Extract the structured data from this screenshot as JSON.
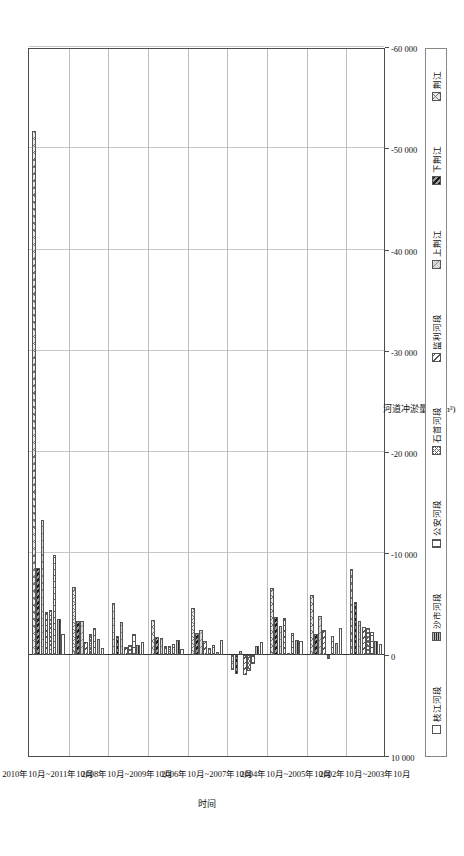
{
  "chart_data": {
    "type": "bar",
    "orientation": "horizontal-grouped",
    "title": "",
    "xlabel": "时间",
    "ylabel": "河道冲淤量(10⁴m³)",
    "ylim": [
      10000,
      -60000
    ],
    "ytick_labels": [
      "10 000",
      "0",
      "-10 000",
      "-20 000",
      "-30 000",
      "-40 000",
      "-50 000",
      "-60 000"
    ],
    "ytick_values": [
      10000,
      0,
      -10000,
      -20000,
      -30000,
      -40000,
      -50000,
      -60000
    ],
    "grid": true,
    "legend_position": "bottom",
    "categories": [
      "2002年10月~2003年10月",
      "",
      "2004年10月~2005年10月",
      "",
      "2006年10月~2007年10月",
      "",
      "2008年10月~2009年10月",
      "",
      "2010年10月~2011年10月"
    ],
    "xtick_labels": [
      "2002年10月~2003年10月",
      "2004年10月~2005年10月",
      "2006年10月~2007年10月",
      "2008年10月~2009年10月",
      "2010年10月~2011年10月"
    ],
    "series": [
      {
        "name": "枝江河段",
        "pattern": "p-zhijiang",
        "values": [
          -1100,
          -2600,
          -1350,
          -1250,
          -1500,
          -600,
          -1250,
          -700,
          -2000
        ]
      },
      {
        "name": "沙市河段",
        "pattern": "p-shashi",
        "values": [
          -1400,
          -1200,
          -1500,
          -900,
          -250,
          -1500,
          -1000,
          -1600,
          -3500
        ]
      },
      {
        "name": "公安河段",
        "pattern": "p-gongan",
        "values": [
          -2200,
          -1800,
          -2100,
          900,
          -950,
          -1100,
          -2000,
          -2600,
          -9800
        ]
      },
      {
        "name": "石首河段",
        "pattern": "p-shishou",
        "values": [
          -2600,
          400,
          -200,
          1600,
          -700,
          -850,
          -1000,
          -2050,
          -4400
        ]
      },
      {
        "name": "监利河段",
        "pattern": "p-jianli",
        "values": [
          -2700,
          -2400,
          -3600,
          2000,
          -1350,
          -900,
          -800,
          -1250,
          -4200
        ]
      },
      {
        "name": "上荆江",
        "pattern": "p-shangjing",
        "values": [
          -3300,
          -3800,
          -2850,
          -350,
          -2450,
          -1700,
          -3250,
          -3300,
          -13300
        ]
      },
      {
        "name": "下荆江",
        "pattern": "p-xiajing",
        "values": [
          -5200,
          -2050,
          -3700,
          1950,
          -2150,
          -1750,
          -1800,
          -3300,
          -8600
        ]
      },
      {
        "name": "荆江",
        "pattern": "p-jingjiang",
        "values": [
          -8500,
          -5900,
          -6600,
          1550,
          -4650,
          -3450,
          -5150,
          -6650,
          -51700
        ]
      }
    ]
  },
  "legend": {
    "items": [
      {
        "label": "枝江河段",
        "pattern": "p-zhijiang"
      },
      {
        "label": "沙市河段",
        "pattern": "p-shashi"
      },
      {
        "label": "公安河段",
        "pattern": "p-gongan"
      },
      {
        "label": "石首河段",
        "pattern": "p-shishou"
      },
      {
        "label": "监利河段",
        "pattern": "p-jianli"
      },
      {
        "label": "上荆江",
        "pattern": "p-shangjing"
      },
      {
        "label": "下荆江",
        "pattern": "p-xiajing"
      },
      {
        "label": "荆江",
        "pattern": "p-jingjiang"
      }
    ]
  },
  "colors": {
    "frame": "#4d4d4d",
    "grid": "#c8c8c8",
    "zero": "#333333",
    "text": "#111111",
    "background": "#ffffff"
  }
}
